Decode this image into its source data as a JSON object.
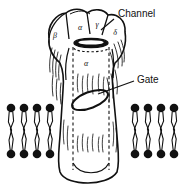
{
  "figure": {
    "background_color": "#ffffff",
    "ink_color": "#111111",
    "width": 182,
    "height": 189
  },
  "annotations": {
    "channel": {
      "label": "Channel",
      "text_x": 118,
      "text_y": 17,
      "leader": "M 114 19 L 101 30"
    },
    "gate": {
      "label": "Gate",
      "text_x": 137,
      "text_y": 83,
      "leader": "M 134 81 L 98 94"
    }
  },
  "subunits": [
    {
      "name": "beta",
      "symbol": "β",
      "x": 55,
      "y": 38,
      "region": "top-left-lobe"
    },
    {
      "name": "alpha-top",
      "symbol": "α",
      "x": 80,
      "y": 30,
      "region": "top-center-lobe"
    },
    {
      "name": "gamma",
      "symbol": "γ",
      "x": 97,
      "y": 27,
      "region": "top-right-lobe"
    },
    {
      "name": "delta",
      "symbol": "δ",
      "x": 115,
      "y": 35,
      "region": "top-far-right-lobe"
    },
    {
      "name": "alpha-pore",
      "symbol": "α",
      "x": 86,
      "y": 66,
      "region": "pore-wall"
    }
  ],
  "membrane": {
    "left_leaflet_count": 4,
    "right_leaflet_count": 4,
    "head_radius": 4.2,
    "top_y": 105,
    "bottom_y": 157,
    "left_x_positions": [
      11,
      24,
      37,
      50
    ],
    "right_x_positions": [
      135,
      148,
      161,
      174
    ]
  },
  "pore": {
    "mouth_label": "channel-mouth",
    "gate_label": "gate-ellipse",
    "dashed_wall_left_x": 72,
    "dashed_wall_right_x": 110
  }
}
